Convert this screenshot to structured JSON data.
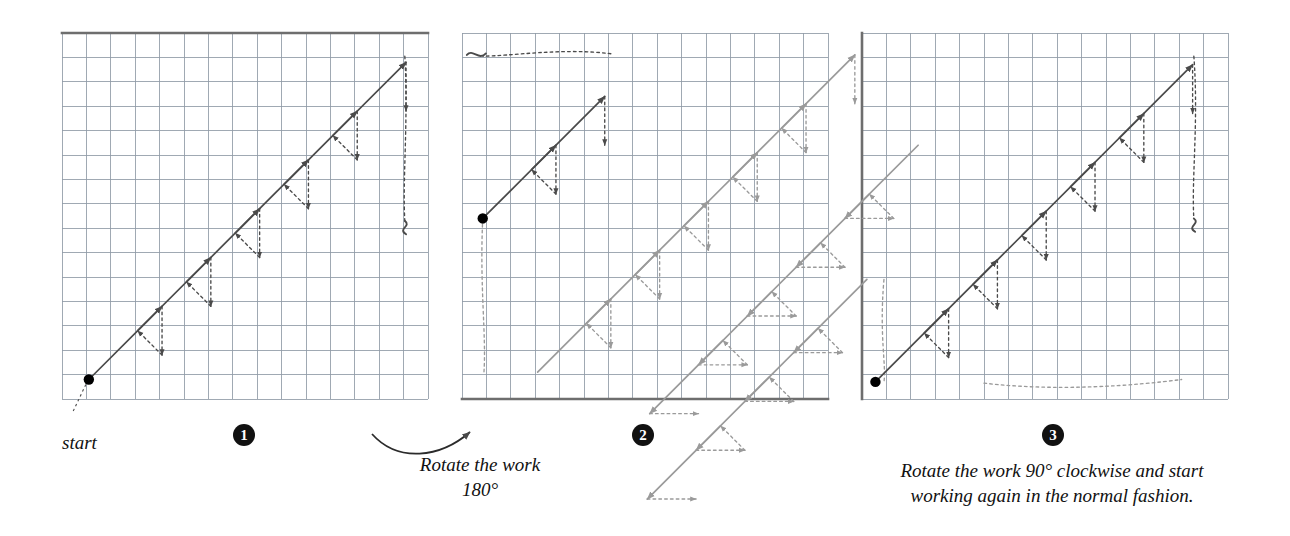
{
  "figure": {
    "background": "#ffffff",
    "ink_dark": "#4a4a4a",
    "ink_darker": "#333333",
    "ink_gray": "#9a9a9a",
    "grid_line": "#8f9aa6",
    "grid_line_light": "#c3cad3",
    "edge_line": "#6e6e6e",
    "dot_color": "#000000"
  },
  "panels": [
    {
      "id": "panel-1",
      "step": "1",
      "x": 62,
      "y": 33,
      "cols": 15,
      "rows": 15,
      "cell": 24.4,
      "edges": [
        "top"
      ],
      "start_dot": {
        "col": 1.1,
        "row": 14.2
      },
      "start_label": "start",
      "rotation_note": ""
    },
    {
      "id": "panel-2",
      "step": "2",
      "x": 462,
      "y": 33,
      "cols": 15,
      "rows": 15,
      "cell": 24.4,
      "edges": [
        "bottom"
      ],
      "start_dot": {
        "col": 0.85,
        "row": 7.6
      },
      "start_label": "",
      "rotation_note": "Rotate the work\n180°"
    },
    {
      "id": "panel-3",
      "step": "3",
      "x": 862,
      "y": 33,
      "cols": 15,
      "rows": 15,
      "cell": 24.4,
      "edges": [
        "left"
      ],
      "start_dot": {
        "col": 0.55,
        "row": 14.3
      },
      "start_label": "",
      "rotation_note": "Rotate the work 90° clockwise and start\nworking again in the normal fashion."
    }
  ],
  "captions": {
    "start": "start",
    "step1_number": "1",
    "step2_number": "2",
    "step3_number": "3",
    "rotate_180": "Rotate the work\n180°",
    "rotate_90": "Rotate the work 90° clockwise and start\nworking again in the normal fashion."
  },
  "stitch_geometry": {
    "description": "Long-armed cross stitch. Each unit: solid arrow diagonal up-right across 3 columns and 3 rows, dashed return straight down 2 rows, dashed travel right/up to next unit start.",
    "solid_run_cols": 3,
    "solid_run_rows": 3,
    "dashed_down_rows": 2,
    "unit_advance_cols": 2,
    "unit_advance_rows": 2,
    "units_per_row": 6,
    "rows_drawn_panel1": 1,
    "rows_drawn_panel2": 2,
    "rows_drawn_panel3": 4
  },
  "chart_data": {
    "type": "diagram",
    "steps": [
      {
        "number": "1",
        "label": "",
        "note": "Work the first diagonal row of stitches from the start point upward to the right."
      },
      {
        "number": "2",
        "label": "",
        "note": "Rotate the work 180° and work a second diagonal row back over the first."
      },
      {
        "number": "3",
        "label": "",
        "note": "Rotate the work 90° clockwise and start working again in the normal fashion."
      }
    ],
    "legend": [
      {
        "key": "solid-arrow",
        "meaning": "stitch on the front of the fabric",
        "color": "#4a4a4a"
      },
      {
        "key": "dashed-line",
        "meaning": "thread travelling on the back of the fabric",
        "color": "#4a4a4a"
      },
      {
        "key": "gray-line",
        "meaning": "stitches worked in a previous pass",
        "color": "#9a9a9a"
      },
      {
        "key": "filled-dot",
        "meaning": "start point / needle emerges",
        "color": "#000000"
      },
      {
        "key": "squiggle",
        "meaning": "loose thread tail",
        "color": "#4a4a4a"
      }
    ]
  }
}
